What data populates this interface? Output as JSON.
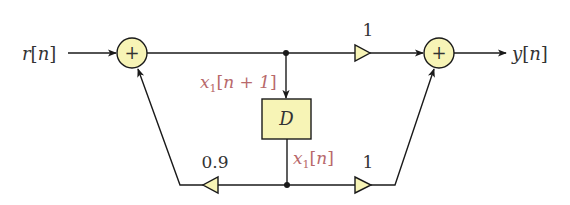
{
  "diagram": {
    "type": "signal-flow block diagram",
    "input_label": {
      "sym": "r",
      "open": "[",
      "arg": "n",
      "close": "]"
    },
    "output_label": {
      "sym": "y",
      "open": "[",
      "arg": "n",
      "close": "]"
    },
    "adder_left": {
      "symbol": "+"
    },
    "adder_right": {
      "symbol": "+"
    },
    "delay_block": {
      "label": "D"
    },
    "gain_top": {
      "value": "1"
    },
    "gain_bottom_right": {
      "value": "1"
    },
    "gain_feedback": {
      "value": "0.9"
    },
    "state_in": {
      "sym": "x",
      "sub": "1",
      "open": "[",
      "arg": "n + 1",
      "close": "]"
    },
    "state_out": {
      "sym": "x",
      "sub": "1",
      "open": "[",
      "arg": "n",
      "close": "]"
    },
    "colors": {
      "block_fill": "#f7f4b6",
      "stroke": "#1a1a1a",
      "state_label": "#b8696b",
      "text": "#333333"
    }
  }
}
